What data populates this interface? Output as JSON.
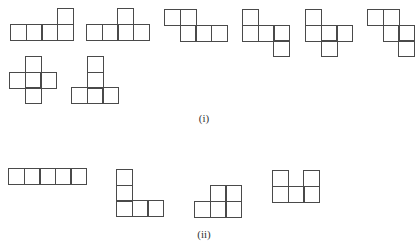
{
  "figure": {
    "part_i": {
      "label": "(i)",
      "label_pos": [
        190,
        112
      ],
      "cell_size": 15.6,
      "shapes": [
        {
          "name": "shape-i-1",
          "origin": [
            10,
            8
          ],
          "cells": [
            [
              3,
              0
            ],
            [
              0,
              1
            ],
            [
              1,
              1
            ],
            [
              2,
              1
            ],
            [
              3,
              1
            ]
          ]
        },
        {
          "name": "shape-i-2",
          "origin": [
            86,
            8
          ],
          "cells": [
            [
              2,
              0
            ],
            [
              0,
              1
            ],
            [
              1,
              1
            ],
            [
              2,
              1
            ],
            [
              3,
              1
            ]
          ]
        },
        {
          "name": "shape-i-3",
          "origin": [
            164,
            9
          ],
          "cells": [
            [
              0,
              0
            ],
            [
              1,
              0
            ],
            [
              1,
              1
            ],
            [
              2,
              1
            ],
            [
              3,
              1
            ]
          ]
        },
        {
          "name": "shape-i-4",
          "origin": [
            242,
            9
          ],
          "cells": [
            [
              0,
              0
            ],
            [
              0,
              1
            ],
            [
              1,
              1
            ],
            [
              2,
              1
            ],
            [
              2,
              2
            ]
          ]
        },
        {
          "name": "shape-i-5",
          "origin": [
            305,
            9
          ],
          "cells": [
            [
              0,
              0
            ],
            [
              0,
              1
            ],
            [
              1,
              1
            ],
            [
              2,
              1
            ],
            [
              1,
              2
            ]
          ]
        },
        {
          "name": "shape-i-6",
          "origin": [
            367,
            9
          ],
          "cells": [
            [
              0,
              0
            ],
            [
              1,
              0
            ],
            [
              1,
              1
            ],
            [
              2,
              1
            ],
            [
              2,
              2
            ]
          ]
        },
        {
          "name": "shape-i-7",
          "origin": [
            9,
            56
          ],
          "cells": [
            [
              1,
              0
            ],
            [
              0,
              1
            ],
            [
              1,
              1
            ],
            [
              2,
              1
            ],
            [
              1,
              2
            ]
          ]
        },
        {
          "name": "shape-i-8",
          "origin": [
            71,
            56
          ],
          "cells": [
            [
              1,
              0
            ],
            [
              1,
              1
            ],
            [
              0,
              2
            ],
            [
              1,
              2
            ],
            [
              2,
              2
            ]
          ]
        }
      ]
    },
    "part_ii": {
      "label": "(ii)",
      "label_pos": [
        190,
        228
      ],
      "cell_size": 15.6,
      "shapes": [
        {
          "name": "shape-ii-1",
          "origin": [
            8,
            168
          ],
          "cells": [
            [
              0,
              0
            ],
            [
              1,
              0
            ],
            [
              2,
              0
            ],
            [
              3,
              0
            ],
            [
              4,
              0
            ]
          ]
        },
        {
          "name": "shape-ii-2",
          "origin": [
            116,
            169
          ],
          "cells": [
            [
              0,
              0
            ],
            [
              0,
              1
            ],
            [
              0,
              2
            ],
            [
              1,
              2
            ],
            [
              2,
              2
            ]
          ]
        },
        {
          "name": "shape-ii-3",
          "origin": [
            194,
            185
          ],
          "cells": [
            [
              1,
              0
            ],
            [
              2,
              0
            ],
            [
              0,
              1
            ],
            [
              1,
              1
            ],
            [
              2,
              1
            ]
          ]
        },
        {
          "name": "shape-ii-4",
          "origin": [
            272,
            170
          ],
          "cells": [
            [
              0,
              0
            ],
            [
              2,
              0
            ],
            [
              0,
              1
            ],
            [
              1,
              1
            ],
            [
              2,
              1
            ]
          ]
        }
      ]
    }
  }
}
